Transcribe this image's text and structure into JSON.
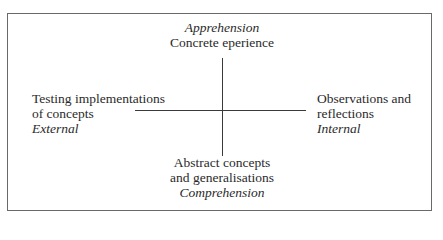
{
  "diagram": {
    "type": "quadrant-axes",
    "top": {
      "mode": "Apprehension",
      "label": "Concrete eperience"
    },
    "bottom": {
      "label_line1": "Abstract concepts",
      "label_line2": "and generalisations",
      "mode": "Comprehension"
    },
    "left": {
      "label_line1": "Testing implementations",
      "label_line2": "of concepts",
      "mode": "External"
    },
    "right": {
      "label_line1": "Observations and",
      "label_line2": "reflections",
      "mode": "Internal"
    }
  }
}
